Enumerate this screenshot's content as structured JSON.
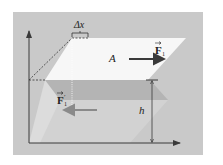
{
  "diagram": {
    "labels": {
      "delta_x": "Δx",
      "area": "A",
      "force_top": "F",
      "force_top_sub": "1",
      "force_bottom": "F",
      "force_bottom_prime": "′",
      "force_bottom_sub": "1",
      "height": "h"
    },
    "colors": {
      "panel": "#c9c9c9",
      "top_plane": "#f7f7f7",
      "mid_band": "#b4b4b4",
      "lower_plane": "#dcdcdc",
      "axis": "#3a3a3a",
      "force_top_arrow": "#3a3a3a",
      "force_bottom_arrow": "#8a8a8a"
    }
  }
}
